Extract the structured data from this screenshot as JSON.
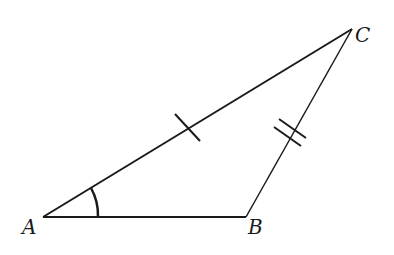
{
  "diagram": {
    "type": "triangle",
    "vertices": [
      {
        "name": "A",
        "x": 43,
        "y": 217,
        "label_x": 22,
        "label_y": 234
      },
      {
        "name": "B",
        "x": 246,
        "y": 217,
        "label_x": 248,
        "label_y": 234
      },
      {
        "name": "C",
        "x": 352,
        "y": 29,
        "label_x": 355,
        "label_y": 42
      }
    ],
    "sides": [
      {
        "name": "AB",
        "from": "A",
        "to": "B",
        "tick_marks": 0
      },
      {
        "name": "AC",
        "from": "A",
        "to": "C",
        "tick_marks": 1
      },
      {
        "name": "BC",
        "from": "B",
        "to": "C",
        "tick_marks": 2
      }
    ],
    "angle_marks": [
      {
        "vertex": "A",
        "arcs": 1
      }
    ],
    "colors": {
      "stroke": "#1a1a1a",
      "background": "#ffffff"
    }
  }
}
